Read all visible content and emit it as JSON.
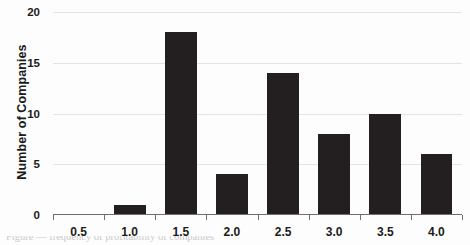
{
  "chart_data": {
    "type": "bar",
    "title": "",
    "subtitle": "",
    "xlabel": "",
    "ylabel": "Number of Companies",
    "categories": [
      "0.5",
      "1.0",
      "1.5",
      "2.0",
      "2.5",
      "3.0",
      "3.5",
      "4.0"
    ],
    "values": [
      0,
      1,
      18,
      4,
      14,
      8,
      10,
      6
    ],
    "ylim": [
      0,
      20
    ],
    "yticks": [
      "0",
      "5",
      "10",
      "15",
      "20"
    ],
    "ytick_values": [
      0,
      5,
      10,
      15,
      20
    ],
    "grid": true,
    "legend": null,
    "legend_position": "none",
    "bar_color": "#231f20",
    "gridline_color": "#e3e3e3",
    "axis_color": "#6f6f6f",
    "background_color": "#ffffff",
    "annotations": []
  },
  "caption": {
    "cropped_line": "Figure — frequency of profitability of companies"
  }
}
